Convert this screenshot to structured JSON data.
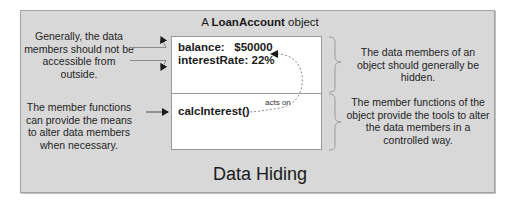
{
  "diagram": {
    "title": "Data Hiding",
    "object_label": {
      "prefix": "A ",
      "class_name": "LoanAccount",
      "suffix": " object"
    },
    "object": {
      "data_members": [
        {
          "label": "balance:   $50000"
        },
        {
          "label": "interestRate: 22%"
        }
      ],
      "member_functions": [
        {
          "label": "calcInterest()"
        }
      ],
      "relation_label": "acts on"
    },
    "left_notes": [
      {
        "text": "Generally, the data members should not be accessible from outside."
      },
      {
        "text": "The member functions can provide the means to alter data members when necessary."
      }
    ],
    "right_notes": [
      {
        "text": "The data members of an object should generally be hidden."
      },
      {
        "text": "The member functions of the object provide the tools to alter the data members in a controlled way."
      }
    ],
    "icons": {
      "blocked_access_arrows": "arrow-deflected-icon",
      "call_arrow": "arrow-right-icon",
      "acts_on_arrow": "dashed-curved-arrow-icon",
      "brace": "right-curly-brace-icon"
    },
    "colors": {
      "panel_fill": "#d8d8d8",
      "panel_border": "#a3a3a3",
      "object_fill": "#ffffff",
      "object_border": "#9a9a9a",
      "text": "#1a1a1a",
      "arrow": "#1a1a1a",
      "dashed_line": "#8a8a8a",
      "brace": "#9a9a9a"
    }
  }
}
